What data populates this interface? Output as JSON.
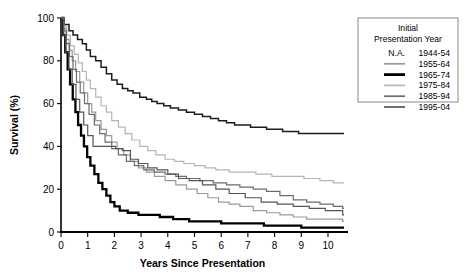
{
  "chart_data": {
    "type": "line",
    "title": "",
    "xlabel": "Years Since Presentation",
    "ylabel": "Survival (%)",
    "xlim": [
      0,
      10.6
    ],
    "ylim": [
      0,
      100
    ],
    "xticks": [
      0,
      1,
      2,
      3,
      4,
      5,
      6,
      7,
      8,
      9,
      10
    ],
    "yticks": [
      0,
      20,
      40,
      60,
      80,
      100
    ],
    "grid": false,
    "step": "post",
    "legend_position": "right-top",
    "legend_title_lines": [
      "Initial",
      "Presentation Year"
    ],
    "series": [
      {
        "name": "1944-54",
        "swatch": "N.A.",
        "has_line_swatch": false,
        "color": "#1c1c1c",
        "width": 1.5,
        "final_value": 46,
        "x": [
          0,
          0.12,
          0.3,
          0.45,
          0.62,
          0.8,
          0.95,
          1.1,
          1.3,
          1.5,
          1.7,
          1.9,
          2.1,
          2.3,
          2.5,
          2.7,
          2.95,
          3.2,
          3.4,
          3.6,
          3.85,
          4.1,
          4.4,
          4.7,
          5.0,
          5.3,
          5.6,
          5.9,
          6.2,
          6.5,
          6.8,
          7.1,
          7.4,
          7.7,
          8.0,
          8.3,
          8.6,
          8.9,
          9.2,
          10.55
        ],
        "y": [
          100,
          97,
          94,
          92,
          90,
          88,
          85,
          82,
          80,
          77,
          74,
          71,
          69,
          67,
          66,
          65,
          63,
          62,
          61,
          60,
          59,
          58,
          57,
          56,
          55,
          54,
          53,
          52,
          51,
          50,
          50,
          49,
          49,
          48,
          48,
          47,
          47,
          46,
          46,
          46
        ]
      },
      {
        "name": "1955-64",
        "swatch": "line",
        "has_line_swatch": true,
        "color": "#9a9a9a",
        "width": 1.2,
        "final_value": 5,
        "x": [
          0,
          0.1,
          0.2,
          0.3,
          0.42,
          0.55,
          0.7,
          0.85,
          1.0,
          1.15,
          1.3,
          1.5,
          1.7,
          1.9,
          2.1,
          2.35,
          2.6,
          2.9,
          3.2,
          3.5,
          3.9,
          4.3,
          4.7,
          5.1,
          5.5,
          5.9,
          6.3,
          6.7,
          7.2,
          7.7,
          8.2,
          8.7,
          9.2,
          10.55
        ],
        "y": [
          100,
          95,
          90,
          85,
          80,
          75,
          70,
          65,
          60,
          56,
          52,
          48,
          45,
          42,
          39,
          36,
          33,
          30,
          28,
          26,
          24,
          22,
          20,
          18,
          16,
          14,
          13,
          12,
          10,
          9,
          8,
          7,
          6,
          5
        ]
      },
      {
        "name": "1965-74",
        "swatch": "line",
        "has_line_swatch": true,
        "color": "#000000",
        "width": 2.3,
        "final_value": 2,
        "x": [
          0,
          0.08,
          0.16,
          0.25,
          0.34,
          0.44,
          0.54,
          0.64,
          0.75,
          0.86,
          0.98,
          1.1,
          1.25,
          1.4,
          1.55,
          1.7,
          1.85,
          2.0,
          2.2,
          2.5,
          2.9,
          3.3,
          3.7,
          4.2,
          4.8,
          5.4,
          6.0,
          6.8,
          7.6,
          8.6,
          9.0,
          10.55
        ],
        "y": [
          100,
          92,
          84,
          76,
          69,
          62,
          56,
          50,
          45,
          40,
          35,
          31,
          27,
          23,
          20,
          17,
          14,
          12,
          10,
          9,
          8,
          8,
          7,
          6,
          5,
          5,
          4,
          4,
          3,
          3,
          2,
          2
        ]
      },
      {
        "name": "1975-84",
        "swatch": "line",
        "has_line_swatch": true,
        "color": "#b5b5b5",
        "width": 1.2,
        "final_value": 23,
        "x": [
          0,
          0.1,
          0.22,
          0.35,
          0.5,
          0.65,
          0.8,
          0.95,
          1.1,
          1.3,
          1.5,
          1.7,
          1.9,
          2.15,
          2.4,
          2.65,
          2.95,
          3.25,
          3.55,
          3.9,
          4.25,
          4.6,
          5.0,
          5.4,
          5.8,
          6.3,
          6.8,
          7.3,
          7.9,
          8.5,
          9.1,
          9.7,
          10.2,
          10.55
        ],
        "y": [
          100,
          96,
          92,
          87,
          83,
          79,
          75,
          71,
          67,
          63,
          59,
          56,
          52,
          49,
          46,
          43,
          40,
          38,
          36,
          34,
          33,
          32,
          31,
          30,
          29,
          28,
          28,
          27,
          26,
          26,
          25,
          24,
          23,
          23
        ]
      },
      {
        "name": "1985-94",
        "swatch": "line",
        "has_line_swatch": true,
        "color": "#6b6b6b",
        "width": 1.2,
        "final_value": 11,
        "x": [
          0,
          0.1,
          0.2,
          0.32,
          0.45,
          0.58,
          0.72,
          0.88,
          1.05,
          1.25,
          1.45,
          1.65,
          1.9,
          2.15,
          2.45,
          2.75,
          3.1,
          3.5,
          3.9,
          4.3,
          4.7,
          5.2,
          5.7,
          6.2,
          6.7,
          7.2,
          7.7,
          8.2,
          8.7,
          9.2,
          9.7,
          10.2,
          10.55
        ],
        "y": [
          100,
          94,
          88,
          82,
          76,
          70,
          65,
          60,
          55,
          50,
          46,
          42,
          39,
          36,
          33,
          31,
          29,
          28,
          27,
          26,
          25,
          24,
          23,
          22,
          21,
          20,
          19,
          17,
          15,
          14,
          13,
          12,
          11
        ]
      },
      {
        "name": "1995-04",
        "swatch": "line",
        "has_line_swatch": true,
        "color": "#555555",
        "width": 1.2,
        "final_value": 8,
        "x": [
          0,
          0.08,
          0.18,
          0.3,
          0.42,
          0.56,
          0.7,
          0.85,
          1.0,
          1.2,
          1.4,
          1.6,
          1.8,
          2.05,
          2.3,
          2.6,
          2.9,
          3.25,
          3.6,
          4.0,
          4.4,
          4.8,
          5.3,
          5.8,
          6.3,
          6.9,
          7.5,
          8.1,
          8.7,
          9.3,
          9.9,
          10.55
        ],
        "y": [
          100,
          92,
          84,
          76,
          69,
          62,
          56,
          50,
          45,
          40,
          40,
          40,
          40,
          39,
          38,
          34,
          32,
          30,
          29,
          27,
          25,
          24,
          22,
          20,
          18,
          16,
          14,
          13,
          12,
          11,
          10,
          8
        ]
      }
    ]
  },
  "legend": {
    "title_line_1": "Initial",
    "title_line_2": "Presentation Year",
    "entries": [
      {
        "swatch_text": "N.A.",
        "label": "1944-54"
      },
      {
        "swatch_text": "",
        "label": "1955-64"
      },
      {
        "swatch_text": "",
        "label": "1965-74"
      },
      {
        "swatch_text": "",
        "label": "1975-84"
      },
      {
        "swatch_text": "",
        "label": "1985-94"
      },
      {
        "swatch_text": "",
        "label": "1995-04"
      }
    ]
  }
}
